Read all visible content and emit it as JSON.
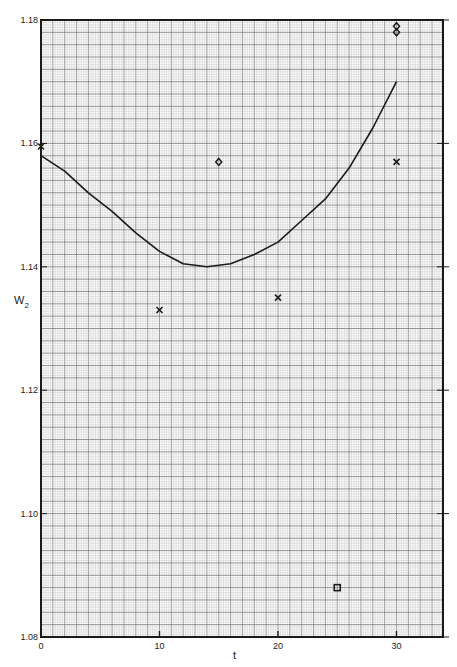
{
  "chart_data": {
    "type": "scatter",
    "title": "",
    "xlabel": "t",
    "ylabel": "W2",
    "ylabel_main": "W",
    "ylabel_sub": "2",
    "xlim": [
      0,
      34
    ],
    "ylim": [
      1.08,
      1.18
    ],
    "grid": true,
    "x_ticks": [
      0,
      10,
      20,
      30
    ],
    "x_tick_labels": [
      "0",
      "10",
      "20",
      "30"
    ],
    "y_ticks": [
      1.08,
      1.1,
      1.12,
      1.14,
      1.16,
      1.18
    ],
    "y_tick_labels": [
      "1.08",
      "1.10",
      "1.12",
      "1.14",
      "1.16",
      "1.18"
    ],
    "series": [
      {
        "name": "fitted curve",
        "kind": "line",
        "x": [
          0,
          2,
          4,
          6,
          8,
          10,
          12,
          14,
          16,
          18,
          20,
          22,
          24,
          26,
          28,
          30
        ],
        "y": [
          1.158,
          1.1555,
          1.152,
          1.149,
          1.1455,
          1.1425,
          1.1405,
          1.14,
          1.1405,
          1.142,
          1.144,
          1.1475,
          1.151,
          1.156,
          1.1625,
          1.17
        ]
      },
      {
        "name": "x markers",
        "kind": "scatter",
        "marker": "x",
        "x": [
          0,
          10,
          20,
          30
        ],
        "y": [
          1.1595,
          1.133,
          1.135,
          1.157
        ]
      },
      {
        "name": "diamond markers",
        "kind": "scatter",
        "marker": "diamond",
        "x": [
          15,
          30,
          30
        ],
        "y": [
          1.157,
          1.179,
          1.178
        ]
      },
      {
        "name": "square markers",
        "kind": "scatter",
        "marker": "square",
        "x": [
          25
        ],
        "y": [
          1.088
        ]
      }
    ]
  },
  "colors": {
    "grid_fine": "#c8c8c8",
    "grid_major": "#7a7a7a",
    "ink": "#1a1a1a",
    "paper": "#ffffff"
  }
}
